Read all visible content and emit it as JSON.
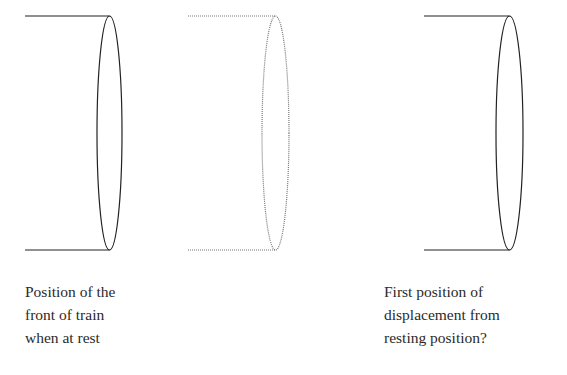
{
  "diagram": {
    "cylinders": [
      {
        "name": "rest-position",
        "x_start": 25,
        "cx": 109.5,
        "rx": 12.5,
        "top": 16,
        "bottom": 250,
        "color": "#222222",
        "style": "solid"
      },
      {
        "name": "intermediate-position",
        "x_start": 188,
        "cx": 275.5,
        "rx": 13.5,
        "top": 16,
        "bottom": 250,
        "color": "#777777",
        "style": "dotted"
      },
      {
        "name": "displaced-position",
        "x_start": 424,
        "cx": 509.5,
        "rx": 13.5,
        "top": 16,
        "bottom": 250,
        "color": "#222222",
        "style": "solid"
      }
    ],
    "labels": {
      "left": "Position of the\nfront of train\nwhen at rest",
      "right": "First position of\ndisplacement from\nresting position?"
    }
  }
}
